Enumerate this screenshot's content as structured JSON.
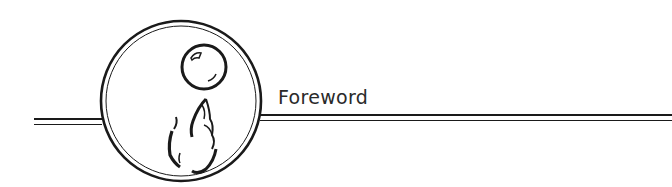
{
  "header": {
    "title": "Foreword",
    "emblem_icon": "hand-holding-crystal-ball-icon"
  },
  "colors": {
    "ink": "#1a1a1a",
    "background": "#ffffff"
  }
}
